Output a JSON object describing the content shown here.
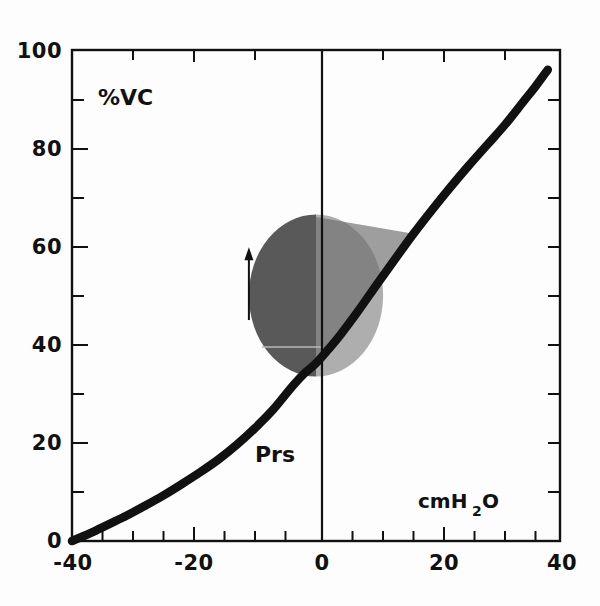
{
  "figure": {
    "name": "pressure-volume-relaxation-curve",
    "background_color": "#fdfdfd",
    "ink_color": "#111111"
  },
  "chart_data": {
    "type": "line",
    "title": "",
    "subtitle": "",
    "xlabel": "cmH2O",
    "ylabel": "%VC",
    "xlim": [
      -40,
      40
    ],
    "ylim": [
      0,
      100
    ],
    "grid": false,
    "legend": null,
    "x_major_ticks": [
      -40,
      -20,
      0,
      20,
      40
    ],
    "x_major_tick_labels": [
      "-40",
      "-20",
      "0",
      "20",
      "40"
    ],
    "x_minor_tick_step": 5,
    "y_major_ticks": [
      0,
      20,
      40,
      60,
      80,
      100
    ],
    "y_major_tick_labels": [
      "0",
      "20",
      "40",
      "60",
      "80",
      "100"
    ],
    "y_minor_tick_step": 10,
    "series": [
      {
        "name": "Prs",
        "label": "Prs",
        "style": "solid-thick-black",
        "color": "#111111",
        "x": [
          -40,
          -37,
          -34,
          -31,
          -28,
          -25,
          -22,
          -19,
          -16,
          -13,
          -10,
          -7,
          -4,
          -2,
          0,
          2,
          4,
          7,
          10,
          13,
          16,
          19,
          22,
          25,
          28,
          31,
          34,
          36,
          38
        ],
        "y": [
          0,
          1.6,
          3.4,
          5.2,
          7.2,
          9.3,
          11.6,
          14.0,
          16.6,
          19.6,
          23.0,
          26.8,
          31.3,
          34.0,
          36.2,
          39.0,
          42.0,
          47.0,
          52.3,
          57.5,
          62.6,
          67.4,
          72.0,
          76.4,
          80.6,
          84.8,
          89.5,
          92.6,
          96.0
        ]
      }
    ],
    "shaded_regions": [
      {
        "name": "tidal-volume-disc-left",
        "color": "#595959",
        "description": "dark gray half-disc left of zero pressure axis",
        "center_x": 0,
        "center_y": 50,
        "radius_x": 11,
        "radius_y": 16.5
      },
      {
        "name": "work-area-right",
        "color": "#9e9e9e",
        "description": "light gray area right of zero pressure axis bounded above at 66 %VC and on the right by the Prs curve",
        "top_y": 66,
        "bottom_y": 36.2,
        "left_x": 0
      }
    ],
    "annotations": [
      {
        "name": "y-axis-label",
        "text": "%VC",
        "x": -33,
        "y": 90
      },
      {
        "name": "curve-label",
        "text": "Prs",
        "x": -11.5,
        "y": 19.5
      },
      {
        "name": "x-axis-unit-label",
        "text": "cmH",
        "subscript": "2",
        "suffix": "O",
        "x": 17,
        "y": 11
      },
      {
        "name": "inspiration-arrow",
        "text": "",
        "x": -11,
        "y_from": 45,
        "y_to": 58,
        "direction": "up"
      }
    ]
  },
  "labels": {
    "y_axis": "%VC",
    "curve": "Prs",
    "x_unit_main": "cmH",
    "x_unit_sub": "2",
    "x_unit_tail": "O",
    "ticks_x": [
      "-40",
      "-20",
      "0",
      "20",
      "40"
    ],
    "ticks_y": [
      "0",
      "20",
      "40",
      "60",
      "80",
      "100"
    ]
  }
}
